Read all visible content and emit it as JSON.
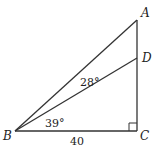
{
  "diagram": {
    "type": "geometry-right-triangle",
    "vertices": {
      "A": {
        "label": "A"
      },
      "B": {
        "label": "B"
      },
      "C": {
        "label": "C"
      },
      "D": {
        "label": "D"
      }
    },
    "angles": {
      "DBA": "28°",
      "CBD": "39°"
    },
    "sides": {
      "BC": "40"
    },
    "right_angle_at": "C",
    "line_color": "#333333"
  }
}
